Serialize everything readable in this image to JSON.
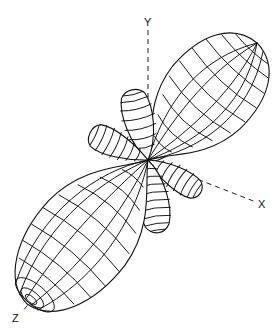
{
  "diagram": {
    "type": "3d-radiation-pattern",
    "axes": {
      "y_label": "Y",
      "x_label": "X",
      "z_label": "Z"
    },
    "origin": [
      148,
      160
    ],
    "lobes": [
      {
        "name": "main-lobe-upper",
        "tip": [
          252,
          48
        ]
      },
      {
        "name": "main-lobe-lower",
        "tip": [
          28,
          305
        ]
      },
      {
        "name": "side-lobe-up",
        "tip": [
          132,
          89
        ]
      },
      {
        "name": "side-lobe-left",
        "tip": [
          89,
          133
        ]
      },
      {
        "name": "side-lobe-down",
        "tip": [
          157,
          236
        ]
      },
      {
        "name": "side-lobe-right",
        "tip": [
          202,
          194
        ]
      },
      {
        "name": "side-lobe-upper-right",
        "tip": [
          208,
          118
        ]
      }
    ],
    "colors": {
      "line": "#111111",
      "background": "#ffffff"
    }
  }
}
